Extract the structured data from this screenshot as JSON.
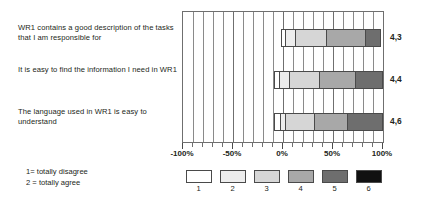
{
  "chart_data": {
    "type": "bar",
    "subtype": "diverging-stacked-bar-horizontal",
    "orientation": "horizontal",
    "stacked": true,
    "title": "",
    "xlabel": "",
    "ylabel": "",
    "xlim": [
      -100,
      100
    ],
    "xtick_values": [
      -100,
      -50,
      0,
      50,
      100
    ],
    "xtick_labels": [
      "-100%",
      "-50%",
      "0%",
      "50%",
      "100%"
    ],
    "minor_gridline_step": 10,
    "grid": true,
    "grid_axis": "x",
    "legend_position": "bottom",
    "categories": [
      "WR1 contains a good description of the tasks that I am responsible for",
      "It is easy to find the information I need in WR1",
      "The language used in WR1 is easy to understand"
    ],
    "series": [
      {
        "name": "1",
        "label": "1",
        "color": "#ffffff",
        "values": [
          -2,
          -4,
          -5
        ]
      },
      {
        "name": "2",
        "label": "2",
        "color": "#ededed",
        "values": [
          -1,
          -4,
          -2
        ]
      },
      {
        "name": "3",
        "label": "3",
        "color": "#d6d6d6",
        "values": [
          1,
          2,
          2
        ]
      },
      {
        "name": "4",
        "label": "4",
        "color": "#a8a8a8",
        "values": [
          30,
          25,
          30
        ]
      },
      {
        "name": "5",
        "label": "5",
        "color": "#6e6e6e",
        "values": [
          40,
          37,
          34
        ]
      },
      {
        "name": "6",
        "label": "6",
        "color": "#111111",
        "values": [
          14,
          26,
          35
        ]
      }
    ],
    "mean_values": [
      "4,3",
      "4,4",
      "4,6"
    ],
    "legend_entries": [
      {
        "key": "1",
        "color": "#ffffff"
      },
      {
        "key": "2",
        "color": "#ededed"
      },
      {
        "key": "3",
        "color": "#d6d6d6"
      },
      {
        "key": "4",
        "color": "#a8a8a8"
      },
      {
        "key": "5",
        "color": "#6e6e6e"
      },
      {
        "key": "6",
        "color": "#111111"
      }
    ],
    "annotations": [
      "1= totally disagree",
      "2 = totally agree"
    ],
    "bar_geometry_percent": [
      {
        "start": -2,
        "segments": [
          3,
          10,
          32,
          40,
          15
        ]
      },
      {
        "start": -9,
        "segments": [
          4,
          10,
          30,
          38,
          27
        ]
      },
      {
        "start": -9,
        "segments": [
          5,
          4,
          30,
          34,
          36
        ]
      }
    ]
  },
  "questions": [
    {
      "id": "q0",
      "text": "WR1 contains a good description of the tasks that I am responsible for"
    },
    {
      "id": "q1",
      "text": "It is easy to find the information I need in WR1"
    },
    {
      "id": "q2",
      "text": "The language used in WR1 is easy to understand"
    }
  ],
  "means": [
    {
      "value": "4,3"
    },
    {
      "value": "4,4"
    },
    {
      "value": "4,6"
    }
  ],
  "axis": {
    "labels": [
      {
        "text": "-100%",
        "pos": -100
      },
      {
        "text": "-50%",
        "pos": -50
      },
      {
        "text": "0%",
        "pos": 0
      },
      {
        "text": "50%",
        "pos": 50
      },
      {
        "text": "100%",
        "pos": 100
      }
    ]
  },
  "scale_note": {
    "line1": "1= totally disagree",
    "line2": "2 = totally agree"
  },
  "legend": {
    "items": [
      {
        "key": "1",
        "color": "#ffffff"
      },
      {
        "key": "2",
        "color": "#ededed"
      },
      {
        "key": "3",
        "color": "#d6d6d6"
      },
      {
        "key": "4",
        "color": "#a8a8a8"
      },
      {
        "key": "5",
        "color": "#6e6e6e"
      },
      {
        "key": "6",
        "color": "#111111"
      }
    ]
  }
}
